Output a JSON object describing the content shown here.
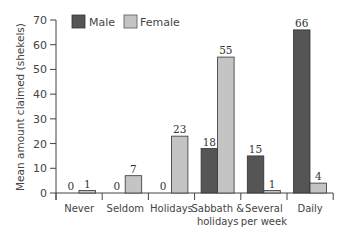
{
  "chart_data": {
    "type": "bar",
    "title": "",
    "xlabel": "",
    "ylabel": "Mean amount claimed (shekels)",
    "ylim": [
      0,
      70
    ],
    "yticks": [
      0,
      10,
      20,
      30,
      40,
      50,
      60,
      70
    ],
    "grid": false,
    "legend_position": "top-left",
    "categories": [
      "Never",
      "Seldom",
      "Holidays",
      "Sabbath & holidays",
      "Several per week",
      "Daily"
    ],
    "category_lines": [
      [
        "Never"
      ],
      [
        "Seldom"
      ],
      [
        "Holidays"
      ],
      [
        "Sabbath &",
        "holidays"
      ],
      [
        "Several",
        "per week"
      ],
      [
        "Daily"
      ]
    ],
    "series": [
      {
        "name": "Male",
        "color": "#555555",
        "values": [
          0,
          0,
          0,
          18,
          15,
          66
        ]
      },
      {
        "name": "Female",
        "color": "#c4c4c4",
        "values": [
          1,
          7,
          23,
          55,
          1,
          4
        ]
      }
    ]
  },
  "legend": {
    "male_label": "Male",
    "female_label": "Female"
  },
  "axis": {
    "ylabel": "Mean amount claimed (shekels)"
  }
}
